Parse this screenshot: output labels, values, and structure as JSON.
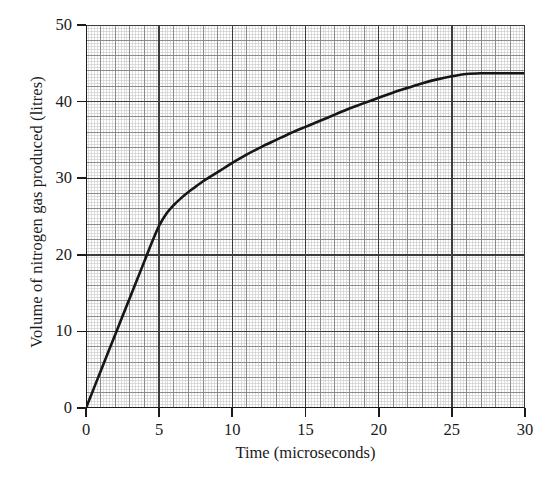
{
  "chart_data": {
    "type": "line",
    "title": "",
    "subtitle": "",
    "xlabel": "Time (microseconds)",
    "ylabel": "Volume of nitrogen gas produced (litres)",
    "xlim": [
      0,
      30
    ],
    "ylim": [
      0,
      50
    ],
    "x_ticks": [
      0,
      5,
      10,
      15,
      20,
      25,
      30
    ],
    "y_ticks": [
      0,
      10,
      20,
      30,
      40,
      50
    ],
    "x_tick_labels": [
      "0",
      "5",
      "10",
      "15",
      "20",
      "25",
      "30"
    ],
    "y_tick_labels": [
      "0",
      "10",
      "20",
      "30",
      "40",
      "50"
    ],
    "x_major_step": 5,
    "y_major_step": 10,
    "x_medium_step": 1,
    "y_medium_step": 2,
    "x_minor_step": 0.2,
    "y_minor_step": 0.4,
    "grid": true,
    "grid_style": "graph-paper",
    "legend": false,
    "legend_position": "none",
    "line_color": "#161616",
    "line_width": 2.6,
    "grid_major_color": "#3c3c3c",
    "grid_medium_color": "#808080",
    "grid_minor_color": "#c8c8c8",
    "axis_color": "#1a1a1a",
    "background_color": "#ffffff",
    "series": [
      {
        "name": "Volume of nitrogen gas produced",
        "x": [
          0,
          0.5,
          1,
          1.5,
          2,
          2.5,
          3,
          3.5,
          4,
          4.5,
          5,
          5.5,
          6,
          6.5,
          7,
          7.5,
          8,
          8.5,
          9,
          9.5,
          10,
          11,
          12,
          13,
          14,
          15,
          16,
          17,
          18,
          19,
          20,
          21,
          22,
          23,
          24,
          25,
          26,
          27,
          28,
          29,
          30
        ],
        "y": [
          0,
          2.4,
          4.8,
          7.2,
          9.6,
          12.0,
          14.4,
          16.8,
          19.2,
          21.6,
          23.8,
          25.4,
          26.5,
          27.4,
          28.2,
          28.9,
          29.6,
          30.2,
          30.8,
          31.4,
          32.0,
          33.1,
          34.1,
          35.0,
          35.9,
          36.7,
          37.5,
          38.3,
          39.1,
          39.8,
          40.5,
          41.2,
          41.8,
          42.4,
          42.9,
          43.3,
          43.6,
          43.7,
          43.7,
          43.7,
          43.7
        ]
      }
    ],
    "annotations": []
  }
}
